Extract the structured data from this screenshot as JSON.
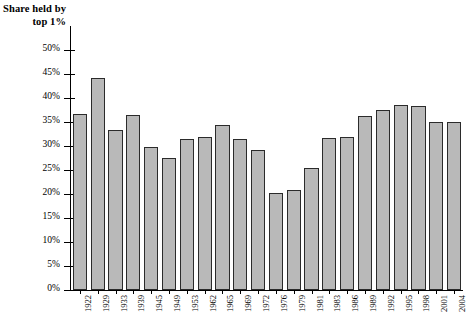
{
  "chart_data": {
    "type": "bar",
    "title": "Share held by top 1%",
    "xlabel": "",
    "ylabel": "Share held by top 1%",
    "ylim": [
      0,
      50
    ],
    "ytick_labels": [
      "0%",
      "5%",
      "10%",
      "15%",
      "20%",
      "25%",
      "30%",
      "35%",
      "40%",
      "45%",
      "50%"
    ],
    "ytick_values": [
      0,
      5,
      10,
      15,
      20,
      25,
      30,
      35,
      40,
      45,
      50
    ],
    "grid": false,
    "legend": "none",
    "bar_fill_color": "#b9b9b9",
    "bar_edge_color": "#2b2b2b",
    "categories": [
      "1922",
      "1929",
      "1933",
      "1939",
      "1945",
      "1949",
      "1953",
      "1962",
      "1965",
      "1969",
      "1972",
      "1976",
      "1979",
      "1981",
      "1983",
      "1986",
      "1989",
      "1992",
      "1995",
      "1998",
      "2001",
      "2004"
    ],
    "values": [
      36.7,
      44.2,
      33.3,
      36.4,
      29.8,
      27.4,
      31.5,
      31.8,
      34.4,
      31.5,
      29.2,
      20.2,
      20.8,
      25.5,
      31.6,
      31.9,
      36.3,
      37.4,
      38.5,
      38.3,
      35.0,
      35.1
    ]
  }
}
